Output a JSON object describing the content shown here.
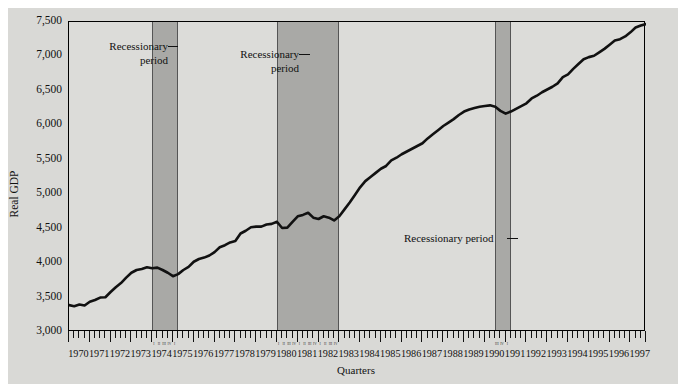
{
  "chart_data": {
    "type": "line",
    "title": "",
    "xlabel": "Quarters",
    "ylabel": "Real GDP",
    "ylim": [
      3000,
      7500
    ],
    "ytick_labels": [
      "7,500",
      "7,000",
      "6,500",
      "6,000",
      "5,500",
      "5,000",
      "4,500",
      "4,000",
      "3,500",
      "3,000"
    ],
    "ytick_values": [
      7500,
      7000,
      6500,
      6000,
      5500,
      5000,
      4500,
      4000,
      3500,
      3000
    ],
    "grid": false,
    "legend": "none",
    "xtick_labels": [
      "1970",
      "1971",
      "1972",
      "1973",
      "1974",
      "1975",
      "1976",
      "1977",
      "1978",
      "1979",
      "1980",
      "1981",
      "1982",
      "1983",
      "1984",
      "1985",
      "1986",
      "1987",
      "1988",
      "1989",
      "1990",
      "1991",
      "1992",
      "1993",
      "1994",
      "1995",
      "1996",
      "1997"
    ],
    "x_minor_note": "quarterly ticks (4 per year)",
    "quarter_marks": [
      "I",
      "II",
      "III",
      "IV"
    ],
    "annotations": [
      {
        "text_line1": "Recessionary",
        "text_line2": "period",
        "target": "1973Q4-1975Q1 band"
      },
      {
        "text_line1": "Recessionary",
        "text_line2": "period",
        "target": "1980Q1-1982Q4 band"
      },
      {
        "text_line1": "Recessionary period",
        "text_line2": "",
        "target": "1990Q3-1991Q1 band"
      }
    ],
    "shaded_regions": [
      {
        "label": "Recessionary period",
        "start": "1974Q1",
        "end": "1975Q1"
      },
      {
        "label": "Recessionary period",
        "start": "1980Q1",
        "end": "1982Q4"
      },
      {
        "label": "Recessionary period",
        "start": "1990Q3",
        "end": "1991Q1"
      }
    ],
    "series": [
      {
        "name": "Real GDP",
        "x": [
          "1970Q1",
          "1970Q2",
          "1970Q3",
          "1970Q4",
          "1971Q1",
          "1971Q2",
          "1971Q3",
          "1971Q4",
          "1972Q1",
          "1972Q2",
          "1972Q3",
          "1972Q4",
          "1973Q1",
          "1973Q2",
          "1973Q3",
          "1973Q4",
          "1974Q1",
          "1974Q2",
          "1974Q3",
          "1974Q4",
          "1975Q1",
          "1975Q2",
          "1975Q3",
          "1975Q4",
          "1976Q1",
          "1976Q2",
          "1976Q3",
          "1976Q4",
          "1977Q1",
          "1977Q2",
          "1977Q3",
          "1977Q4",
          "1978Q1",
          "1978Q2",
          "1978Q3",
          "1978Q4",
          "1979Q1",
          "1979Q2",
          "1979Q3",
          "1979Q4",
          "1980Q1",
          "1980Q2",
          "1980Q3",
          "1980Q4",
          "1981Q1",
          "1981Q2",
          "1981Q3",
          "1981Q4",
          "1982Q1",
          "1982Q2",
          "1982Q3",
          "1982Q4",
          "1983Q1",
          "1983Q2",
          "1983Q3",
          "1983Q4",
          "1984Q1",
          "1984Q2",
          "1984Q3",
          "1984Q4",
          "1985Q1",
          "1985Q2",
          "1985Q3",
          "1985Q4",
          "1986Q1",
          "1986Q2",
          "1986Q3",
          "1986Q4",
          "1987Q1",
          "1987Q2",
          "1987Q3",
          "1987Q4",
          "1988Q1",
          "1988Q2",
          "1988Q3",
          "1988Q4",
          "1989Q1",
          "1989Q2",
          "1989Q3",
          "1989Q4",
          "1990Q1",
          "1990Q2",
          "1990Q3",
          "1990Q4",
          "1991Q1",
          "1991Q2",
          "1991Q3",
          "1991Q4",
          "1992Q1",
          "1992Q2",
          "1992Q3",
          "1992Q4",
          "1993Q1",
          "1993Q2",
          "1993Q3",
          "1993Q4",
          "1994Q1",
          "1994Q2",
          "1994Q3",
          "1994Q4",
          "1995Q1",
          "1995Q2",
          "1995Q3",
          "1995Q4",
          "1996Q1",
          "1996Q2",
          "1996Q3",
          "1996Q4",
          "1997Q1",
          "1997Q2",
          "1997Q3",
          "1997Q4"
        ],
        "values": [
          3390,
          3375,
          3400,
          3385,
          3440,
          3465,
          3500,
          3505,
          3580,
          3650,
          3710,
          3790,
          3860,
          3900,
          3915,
          3940,
          3925,
          3935,
          3900,
          3860,
          3810,
          3840,
          3900,
          3945,
          4020,
          4060,
          4080,
          4110,
          4160,
          4230,
          4260,
          4300,
          4320,
          4430,
          4470,
          4520,
          4530,
          4530,
          4560,
          4570,
          4600,
          4510,
          4515,
          4600,
          4680,
          4700,
          4730,
          4660,
          4640,
          4680,
          4660,
          4620,
          4680,
          4780,
          4880,
          4990,
          5100,
          5190,
          5250,
          5310,
          5370,
          5410,
          5490,
          5530,
          5580,
          5620,
          5660,
          5700,
          5740,
          5810,
          5870,
          5930,
          5990,
          6040,
          6090,
          6150,
          6200,
          6230,
          6250,
          6270,
          6280,
          6290,
          6270,
          6210,
          6170,
          6200,
          6240,
          6280,
          6320,
          6390,
          6430,
          6480,
          6520,
          6560,
          6610,
          6700,
          6740,
          6820,
          6890,
          6960,
          6990,
          7010,
          7060,
          7110,
          7170,
          7230,
          7250,
          7290,
          7350,
          7420,
          7450,
          7470
        ]
      }
    ]
  },
  "axis": {
    "y_title": "Real GDP",
    "x_title": "Quarters"
  },
  "annotation_1": {
    "line1": "Recessionary",
    "line2": "period"
  },
  "annotation_2": {
    "line1": "Recessionary",
    "line2": "period"
  },
  "annotation_3": {
    "line1": "Recessionary period"
  },
  "colors": {
    "figure_background": "#d9d9d6",
    "plot_background": "#dcdcd9",
    "band_fill": "#a9a9a6",
    "line": "#111111",
    "frame": "#000000"
  }
}
